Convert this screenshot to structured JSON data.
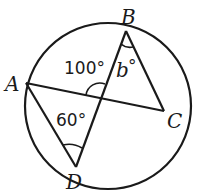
{
  "diagram": {
    "type": "circle-with-inscribed-quadrilateral-diagonals",
    "points": {
      "A": {
        "label": "A",
        "x": 26,
        "y": 83
      },
      "B": {
        "label": "B",
        "x": 126,
        "y": 31
      },
      "C": {
        "label": "C",
        "x": 164,
        "y": 111
      },
      "D": {
        "label": "D",
        "x": 76,
        "y": 167
      }
    },
    "intersection": {
      "x": 100,
      "y": 98
    },
    "angles": {
      "angle_intersection": {
        "label": "100°"
      },
      "angle_B": {
        "label_var": "b",
        "label_deg": "°"
      },
      "angle_D": {
        "label": "60°"
      }
    },
    "colors": {
      "stroke": "#1a1a1a",
      "background": "#ffffff"
    }
  }
}
